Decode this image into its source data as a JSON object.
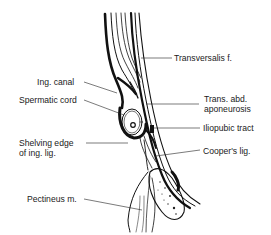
{
  "figure": {
    "type": "anatomical-cross-section",
    "labels": {
      "transversalis": "Transversalis f.",
      "ing_canal": "Ing. canal",
      "spermatic_cord": "Spermatic cord",
      "trans_abd_1": "Trans. abd.",
      "trans_abd_2": "aponeurosis",
      "iliopubic": "Iliopubic tract",
      "shelving_1": "Shelving edge",
      "shelving_2": "of ing. lig.",
      "coopers": "Cooper's lig.",
      "pectineus": "Pectineus m."
    }
  }
}
